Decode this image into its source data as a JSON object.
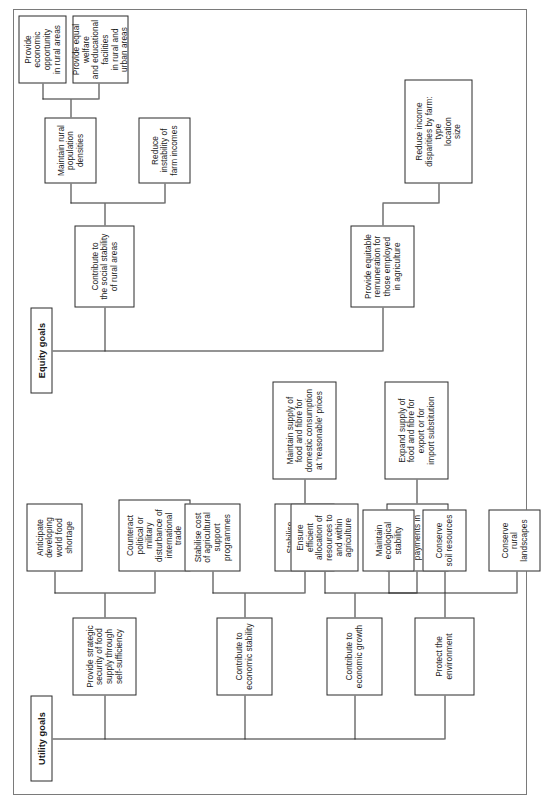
{
  "figure": {
    "orientation": "rotated-90-ccw",
    "line_color": "#2b2b2b",
    "box_fill": "#ffffff",
    "page_border_color": "#7a7a7a"
  },
  "utility": {
    "title": "Utility goals",
    "branches": {
      "food_security": {
        "label": "Provide strategic\nsecurity of food\nsupply through\nself-sufficiency",
        "children": [
          "Anticipate\ndeveloping\nworld food\nshortage",
          "Counteract\npolitical or\nmilitary\ndisturbance of\ninternational\ntrade"
        ]
      },
      "economic_stability": {
        "label": "Contribute to\neconomic stability",
        "children": [
          "Stabilise cost\nof agricultural\nsupport\nprogrammes",
          "Stabilise\ndomestic food\nand fibre\nprices"
        ],
        "grandchild": "Maintain supply of\nfood and fibre for\ndomestic consumption\nat 'reasonable' prices"
      },
      "economic_growth": {
        "label": "Contribute to\neconomic growth",
        "children": [
          "Ensure\nefficient\nallocation of\nresources to\nand within\nagriculture",
          "Improve\nbalance of\npayments in\ninternational\ntrade"
        ],
        "grandchild": "Expand supply of\nfood and fibre for\nexport or for\nimport substitution"
      },
      "environment": {
        "label": "Protect the\nenvironment",
        "children": [
          "Maintain\necological\nstability",
          "Conserve\nsoil resources",
          "Conserve\nrural\nlandscapes"
        ]
      }
    }
  },
  "equity": {
    "title": "Equity goals",
    "branches": {
      "rural_social_stability": {
        "label": "Contribute to\nthe social stability\nof rural areas",
        "children": [
          "Maintain rural\npopulation\ndensities",
          "Reduce\ninstability of\nfarm incomes"
        ],
        "grandchildren": [
          "Provide economic\nopportunity\nin rural areas",
          "Provide equal welfare\nand educational facilities\nin rural and urban areas"
        ]
      },
      "remuneration": {
        "label": "Provide equitable\nremuneration for\nthose employed\nin agriculture",
        "children": [
          "Reduce income disparities by farm:\ntype\nlocation\nsize"
        ]
      }
    }
  }
}
